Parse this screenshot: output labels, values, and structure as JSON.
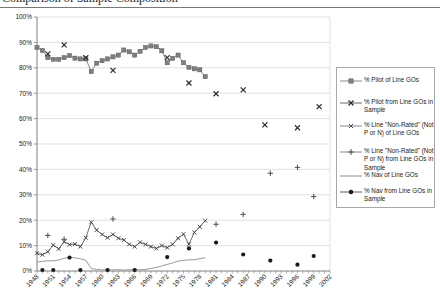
{
  "page": {
    "title_partial": "Comparison of Sample Composition"
  },
  "colors": {
    "background": "#ffffff",
    "grid": "#d9d9d9",
    "axis": "#808080",
    "text": "#1a1a1a",
    "legend_border": "#a8a8a8",
    "title_rule": "#787878"
  },
  "chart_data": {
    "type": "line",
    "title": "Comparison of Sample Composition",
    "xlabel": "",
    "ylabel": "",
    "xlim": [
      1948,
      2002
    ],
    "ylim": [
      0,
      100
    ],
    "y_tick_step": 10,
    "y_tick_format": "percent",
    "x_ticks": [
      1948,
      1951,
      1954,
      1957,
      1960,
      1963,
      1966,
      1969,
      1972,
      1975,
      1978,
      1981,
      1984,
      1987,
      1990,
      1993,
      1996,
      1999,
      2002
    ],
    "grid": "horizontal",
    "legend_position": "right",
    "series": [
      {
        "name": "% Pilot of Line GOs",
        "marker": "square",
        "line": true,
        "color": "#7f7f7f",
        "line_color": "#8c8c8c",
        "points": [
          [
            1948,
            88
          ],
          [
            1949,
            86.8
          ],
          [
            1950,
            84
          ],
          [
            1951,
            83.3
          ],
          [
            1952,
            83.3
          ],
          [
            1953,
            84
          ],
          [
            1954,
            84.8
          ],
          [
            1955,
            83.8
          ],
          [
            1956,
            83.5
          ],
          [
            1957,
            83.5
          ],
          [
            1958,
            78.5
          ],
          [
            1959,
            81.8
          ],
          [
            1960,
            82.8
          ],
          [
            1961,
            83.5
          ],
          [
            1962,
            84.3
          ],
          [
            1963,
            85
          ],
          [
            1964,
            87
          ],
          [
            1965,
            86.3
          ],
          [
            1966,
            85
          ],
          [
            1967,
            86.5
          ],
          [
            1968,
            88
          ],
          [
            1969,
            88.6
          ],
          [
            1970,
            88.3
          ],
          [
            1971,
            86.7
          ],
          [
            1972,
            82
          ],
          [
            1973,
            83.7
          ],
          [
            1974,
            85
          ],
          [
            1975,
            82
          ],
          [
            1976,
            80.2
          ],
          [
            1977,
            79.6
          ],
          [
            1978,
            79.2
          ],
          [
            1979,
            76.5
          ]
        ]
      },
      {
        "name": "% Pilot from Line GOs in Sample",
        "marker": "X",
        "line": false,
        "color": "#2b2b2b",
        "line_color": "#555555",
        "points": [
          [
            1950,
            85.5
          ],
          [
            1953,
            89
          ],
          [
            1957,
            84
          ],
          [
            1962,
            79
          ],
          [
            1972,
            84
          ],
          [
            1976,
            74
          ],
          [
            1981,
            69.8
          ],
          [
            1986,
            71.3
          ],
          [
            1990,
            57.5
          ],
          [
            1996,
            56.4
          ],
          [
            2000,
            64.7
          ]
        ]
      },
      {
        "name": "% Line \"Non-Rated\" (Not P or N) of Line GOs",
        "marker": "x",
        "line": true,
        "color": "#3c3c3c",
        "line_color": "#6b6b6b",
        "points": [
          [
            1948,
            7
          ],
          [
            1949,
            6.4
          ],
          [
            1950,
            7.6
          ],
          [
            1951,
            10.2
          ],
          [
            1952,
            8.7
          ],
          [
            1953,
            11.5
          ],
          [
            1954,
            10.4
          ],
          [
            1955,
            10.6
          ],
          [
            1956,
            9.6
          ],
          [
            1957,
            13.1
          ],
          [
            1958,
            19.2
          ],
          [
            1959,
            16.1
          ],
          [
            1960,
            14.4
          ],
          [
            1961,
            13.1
          ],
          [
            1962,
            14.4
          ],
          [
            1963,
            12.9
          ],
          [
            1964,
            12.2
          ],
          [
            1965,
            10.5
          ],
          [
            1966,
            9.6
          ],
          [
            1967,
            11.3
          ],
          [
            1968,
            10.5
          ],
          [
            1969,
            9.6
          ],
          [
            1970,
            8.9
          ],
          [
            1971,
            10
          ],
          [
            1972,
            9.2
          ],
          [
            1973,
            10.5
          ],
          [
            1974,
            12.9
          ],
          [
            1975,
            14.5
          ],
          [
            1976,
            10.5
          ],
          [
            1977,
            15.2
          ],
          [
            1978,
            17.4
          ],
          [
            1979,
            19.8
          ]
        ]
      },
      {
        "name": "% Line \"Non-Rated\" (Not P or N) from Line GOs in Sample",
        "marker": "plus",
        "line": false,
        "color": "#3c3c3c",
        "line_color": "#6b6b6b",
        "points": [
          [
            1950,
            14
          ],
          [
            1953,
            12.5
          ],
          [
            1962,
            20.5
          ],
          [
            1981,
            18.4
          ],
          [
            1986,
            22.3
          ],
          [
            1991,
            38.5
          ],
          [
            1996,
            40.8
          ],
          [
            1999,
            29.3
          ]
        ]
      },
      {
        "name": "% Nav of Line GOs",
        "marker": "none",
        "line": true,
        "color": "#8c8c8c",
        "line_color": "#8c8c8c",
        "points": [
          [
            1948,
            3.5
          ],
          [
            1949,
            3.8
          ],
          [
            1950,
            4
          ],
          [
            1951,
            4
          ],
          [
            1952,
            4.3
          ],
          [
            1953,
            5
          ],
          [
            1954,
            5.3
          ],
          [
            1955,
            5.2
          ],
          [
            1956,
            4.8
          ],
          [
            1957,
            4.2
          ],
          [
            1958,
            1
          ],
          [
            1959,
            0.6
          ],
          [
            1960,
            0.4
          ],
          [
            1961,
            0.4
          ],
          [
            1962,
            0.4
          ],
          [
            1963,
            0.5
          ],
          [
            1964,
            0.4
          ],
          [
            1965,
            0.5
          ],
          [
            1966,
            0.5
          ],
          [
            1967,
            0.5
          ],
          [
            1968,
            0.6
          ],
          [
            1969,
            1
          ],
          [
            1970,
            1.4
          ],
          [
            1971,
            2
          ],
          [
            1972,
            2.6
          ],
          [
            1973,
            3.2
          ],
          [
            1974,
            3.9
          ],
          [
            1975,
            4.2
          ],
          [
            1976,
            4.4
          ],
          [
            1977,
            4.4
          ],
          [
            1978,
            4.9
          ],
          [
            1979,
            5.2
          ]
        ]
      },
      {
        "name": "% Nav from Line GOs in Sample",
        "marker": "circle",
        "line": false,
        "color": "#1a1a1a",
        "line_color": "#333333",
        "points": [
          [
            1949,
            0.4
          ],
          [
            1951,
            0.4
          ],
          [
            1954,
            5.3
          ],
          [
            1956,
            0.4
          ],
          [
            1961,
            0.4
          ],
          [
            1966,
            0.4
          ],
          [
            1972,
            5.5
          ],
          [
            1976,
            8.9
          ],
          [
            1981,
            11.2
          ],
          [
            1986,
            6.5
          ],
          [
            1991,
            4.1
          ],
          [
            1996,
            2.5
          ],
          [
            1999,
            5.9
          ]
        ]
      }
    ]
  }
}
